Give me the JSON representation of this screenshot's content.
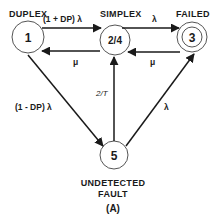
{
  "diagram": {
    "type": "markov-state-transition",
    "caption": "(A)",
    "states": [
      {
        "id": "1",
        "label": "DUPLEX",
        "number": "1"
      },
      {
        "id": "2/4",
        "label": "SIMPLEX",
        "number": "2/4"
      },
      {
        "id": "3",
        "label": "FAILED",
        "number": "3",
        "absorbing": true
      },
      {
        "id": "5",
        "label_line1": "UNDETECTED",
        "label_line2": "FAULT",
        "number": "5"
      }
    ],
    "transitions": [
      {
        "from": "1",
        "to": "2/4",
        "rate": "(1 + DP) λ"
      },
      {
        "from": "2/4",
        "to": "1",
        "rate": "μ"
      },
      {
        "from": "2/4",
        "to": "3",
        "rate": "λ"
      },
      {
        "from": "3",
        "to": "2/4",
        "rate": "μ"
      },
      {
        "from": "1",
        "to": "5",
        "rate": "(1 - DP) λ"
      },
      {
        "from": "5",
        "to": "2/4",
        "rate": "2/T"
      },
      {
        "from": "5",
        "to": "3",
        "rate": "λ"
      }
    ]
  }
}
